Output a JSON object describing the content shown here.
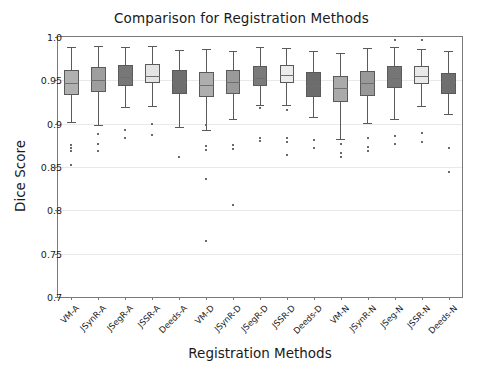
{
  "chart_data": {
    "type": "box",
    "title": "Comparison for Registration Methods",
    "xlabel": "Registration Methods",
    "ylabel": "Dice Score",
    "ylim": [
      0.7,
      1.0
    ],
    "yticks": [
      0.7,
      0.75,
      0.8,
      0.85,
      0.9,
      0.95,
      1.0
    ],
    "ytick_labels": [
      "0.7",
      "0.75",
      "0.8",
      "0.85",
      "0.9",
      "0.95",
      "1.0"
    ],
    "grid": true,
    "legend": "none",
    "categories": [
      "VM-A",
      "JSynR-A",
      "JSegR-A",
      "JSSR-A",
      "Deeds-A",
      "VM-D",
      "JSynR-D",
      "JSegR-D",
      "JSSR-D",
      "Deeds-D",
      "VM-N",
      "JSynR-N",
      "JSeg-N",
      "JSSR-N",
      "Deeds-N"
    ],
    "boxes": [
      {
        "label": "VM-A",
        "color": "#b0b0b0",
        "whisker_low": 0.902,
        "q1": 0.933,
        "median": 0.947,
        "q3": 0.962,
        "whisker_high": 0.988,
        "fliers": [
          0.875,
          0.872,
          0.868,
          0.852
        ]
      },
      {
        "label": "JSynR-A",
        "color": "#9e9e9e",
        "whisker_low": 0.899,
        "q1": 0.937,
        "median": 0.95,
        "q3": 0.965,
        "whisker_high": 0.99,
        "fliers": [
          0.888,
          0.876,
          0.869
        ]
      },
      {
        "label": "JSegR-A",
        "color": "#777777",
        "whisker_low": 0.919,
        "q1": 0.944,
        "median": 0.954,
        "q3": 0.968,
        "whisker_high": 0.989,
        "fliers": [
          0.893,
          0.884
        ]
      },
      {
        "label": "JSSR-A",
        "color": "#e4e4e4",
        "whisker_low": 0.92,
        "q1": 0.947,
        "median": 0.955,
        "q3": 0.969,
        "whisker_high": 0.99,
        "fliers": [
          0.9,
          0.887
        ]
      },
      {
        "label": "Deeds-A",
        "color": "#6e6e6e",
        "whisker_low": 0.896,
        "q1": 0.934,
        "median": 0.948,
        "q3": 0.962,
        "whisker_high": 0.985,
        "fliers": [
          0.862
        ]
      },
      {
        "label": "VM-D",
        "color": "#aeaeae",
        "whisker_low": 0.893,
        "q1": 0.931,
        "median": 0.945,
        "q3": 0.96,
        "whisker_high": 0.986,
        "fliers": [
          0.898,
          0.874,
          0.87,
          0.836,
          0.765
        ]
      },
      {
        "label": "JSynR-D",
        "color": "#9a9a9a",
        "whisker_low": 0.905,
        "q1": 0.934,
        "median": 0.948,
        "q3": 0.962,
        "whisker_high": 0.984,
        "fliers": [
          0.875,
          0.871,
          0.806
        ]
      },
      {
        "label": "JSegR-D",
        "color": "#7b7b7b",
        "whisker_low": 0.922,
        "q1": 0.944,
        "median": 0.953,
        "q3": 0.967,
        "whisker_high": 0.988,
        "fliers": [
          0.918,
          0.884,
          0.88
        ]
      },
      {
        "label": "JSSR-D",
        "color": "#ececec",
        "whisker_low": 0.922,
        "q1": 0.947,
        "median": 0.956,
        "q3": 0.968,
        "whisker_high": 0.987,
        "fliers": [
          0.916,
          0.884,
          0.879,
          0.864
        ]
      },
      {
        "label": "Deeds-D",
        "color": "#6c6c6c",
        "whisker_low": 0.908,
        "q1": 0.931,
        "median": 0.944,
        "q3": 0.96,
        "whisker_high": 0.984,
        "fliers": [
          0.881,
          0.872
        ]
      },
      {
        "label": "VM-N",
        "color": "#aaaaaa",
        "whisker_low": 0.882,
        "q1": 0.925,
        "median": 0.941,
        "q3": 0.955,
        "whisker_high": 0.982,
        "fliers": [
          0.876,
          0.866,
          0.861
        ]
      },
      {
        "label": "JSynR-N",
        "color": "#999999",
        "whisker_low": 0.901,
        "q1": 0.932,
        "median": 0.947,
        "q3": 0.961,
        "whisker_high": 0.987,
        "fliers": [
          0.884,
          0.873,
          0.869
        ]
      },
      {
        "label": "JSeg-N",
        "color": "#767676",
        "whisker_low": 0.905,
        "q1": 0.941,
        "median": 0.953,
        "q3": 0.966,
        "whisker_high": 0.989,
        "fliers": [
          0.996,
          0.886,
          0.877
        ]
      },
      {
        "label": "JSSR-N",
        "color": "#e9e9e9",
        "whisker_low": 0.92,
        "q1": 0.946,
        "median": 0.955,
        "q3": 0.967,
        "whisker_high": 0.986,
        "fliers": [
          0.996,
          0.889,
          0.879
        ]
      },
      {
        "label": "Deeds-N",
        "color": "#6f6f6f",
        "whisker_low": 0.911,
        "q1": 0.934,
        "median": 0.948,
        "q3": 0.959,
        "whisker_high": 0.984,
        "fliers": [
          0.872,
          0.844
        ]
      }
    ]
  }
}
